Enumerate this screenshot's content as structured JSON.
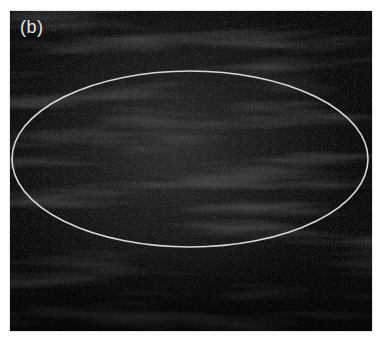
{
  "figure": {
    "panel_label": "(b)",
    "background_color": "#0c0c0c",
    "roi": {
      "shape": "ellipse",
      "stroke_color": "#d8d8d8",
      "cx": 180,
      "cy": 148,
      "rx": 178,
      "ry": 88
    }
  }
}
